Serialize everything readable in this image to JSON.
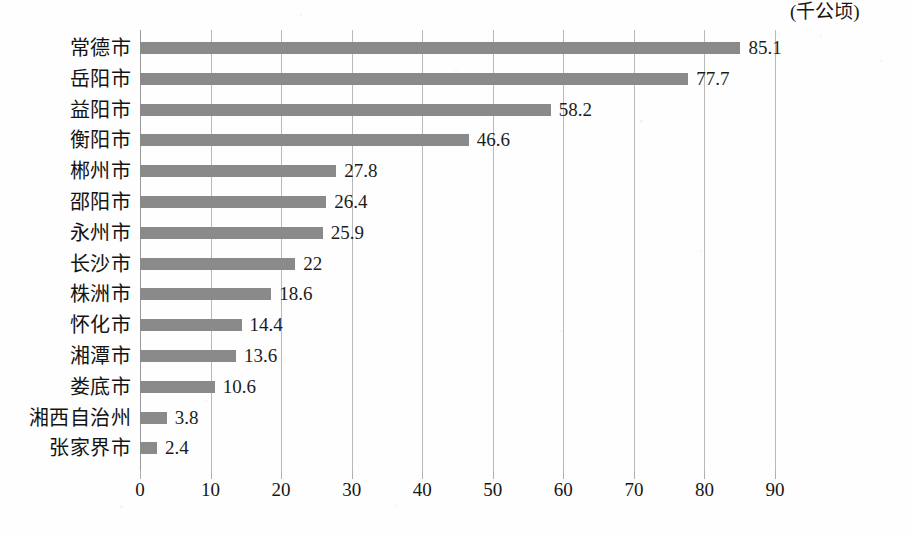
{
  "chart_data": {
    "type": "bar",
    "orientation": "horizontal",
    "title": "",
    "xlabel": "(千公顷)",
    "ylabel": "",
    "xlim": [
      0,
      90
    ],
    "xticks": [
      "0",
      "10",
      "20",
      "30",
      "40",
      "50",
      "60",
      "70",
      "80",
      "90"
    ],
    "xtick_values": [
      0,
      10,
      20,
      30,
      40,
      50,
      60,
      70,
      80,
      90
    ],
    "grid": true,
    "legend": false,
    "categories": [
      "常德市",
      "岳阳市",
      "益阳市",
      "衡阳市",
      "郴州市",
      "邵阳市",
      "永州市",
      "长沙市",
      "株洲市",
      "怀化市",
      "湘潭市",
      "娄底市",
      "湘西自治州",
      "张家界市"
    ],
    "values": [
      85.1,
      77.7,
      58.2,
      46.6,
      27.8,
      26.4,
      25.9,
      22,
      18.6,
      14.4,
      13.6,
      10.6,
      3.8,
      2.4
    ],
    "value_labels": [
      "85.1",
      "77.7",
      "58.2",
      "46.6",
      "27.8",
      "26.4",
      "25.9",
      "22",
      "18.6",
      "14.4",
      "13.6",
      "10.6",
      "3.8",
      "2.4"
    ],
    "bar_color": "#8a8a8a",
    "gridline_color": "#b9b9b9",
    "text_color": "#141414",
    "background_color": "#fefefe"
  },
  "caption": {
    "text": ""
  }
}
